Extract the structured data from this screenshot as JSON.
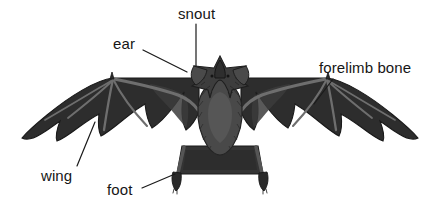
{
  "figure": {
    "view": "front view with wings spread",
    "background_color": "#ffffff",
    "colors": {
      "membrane_dark": "#2b2b2b",
      "membrane_mid": "#3a3a3a",
      "bone_gray": "#6e6e6e",
      "body_fur": "#4a4a4a",
      "outline": "#1a1a1a",
      "label_text": "#161616",
      "leader_line": "#1a1a1a"
    },
    "labels": [
      {
        "id": "snout",
        "text": "snout",
        "text_x": 178,
        "text_y": 6,
        "leader": {
          "from_x": 196,
          "from_y": 24,
          "to_x": 196,
          "to_y": 66
        }
      },
      {
        "id": "ear",
        "text": "ear",
        "text_x": 113,
        "text_y": 36,
        "leader": {
          "from_x": 143,
          "from_y": 50,
          "to_x": 187,
          "to_y": 72
        }
      },
      {
        "id": "forelimb-bone",
        "text": "forelimb bone",
        "text_x": 319,
        "text_y": 60,
        "leader": {
          "from_x": 333,
          "from_y": 79,
          "to_x": 314,
          "to_y": 104
        }
      },
      {
        "id": "wing",
        "text": "wing",
        "text_x": 41,
        "text_y": 168,
        "leader": {
          "from_x": 77,
          "from_y": 166,
          "to_x": 95,
          "to_y": 122
        }
      },
      {
        "id": "foot",
        "text": "foot",
        "text_x": 107,
        "text_y": 182,
        "leader": {
          "from_x": 142,
          "from_y": 188,
          "to_x": 175,
          "to_y": 174
        }
      }
    ],
    "parts": [
      {
        "name": "left-wing-membrane",
        "label": "wing"
      },
      {
        "name": "right-wing-membrane",
        "label": "wing"
      },
      {
        "name": "left-forelimb-bone",
        "label": "forelimb bone"
      },
      {
        "name": "right-forelimb-bone",
        "label": "forelimb bone"
      },
      {
        "name": "head",
        "label": "snout"
      },
      {
        "name": "left-ear",
        "label": "ear"
      },
      {
        "name": "right-ear",
        "label": "ear"
      },
      {
        "name": "body",
        "label": "body"
      },
      {
        "name": "tail-membrane",
        "label": "tail membrane"
      },
      {
        "name": "left-foot",
        "label": "foot"
      },
      {
        "name": "right-foot",
        "label": "foot"
      }
    ]
  }
}
